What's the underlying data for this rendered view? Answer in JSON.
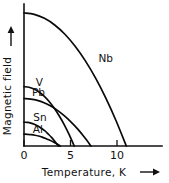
{
  "chart_data": {
    "type": "line",
    "title": "",
    "xlabel": "Temperature, K",
    "ylabel": "Magnetic field",
    "xlim": [
      0,
      12.3
    ],
    "ylim": [
      0,
      1.0
    ],
    "grid": false,
    "legend": "inline-curve-labels",
    "x_ticks": [
      {
        "value": 0,
        "label": "0"
      },
      {
        "value": 5,
        "label": "5"
      },
      {
        "value": 10,
        "label": "10"
      }
    ],
    "y_ticks": [],
    "x_axis_arrow": true,
    "y_axis_arrow": true,
    "series": [
      {
        "name": "Nb",
        "label": "Nb",
        "critical_temperature_K": 11.0,
        "critical_field_relative": 1.0,
        "points": [
          {
            "x": 0.0,
            "y": 1.0
          },
          {
            "x": 1.1,
            "y": 0.99
          },
          {
            "x": 2.2,
            "y": 0.96
          },
          {
            "x": 3.3,
            "y": 0.91
          },
          {
            "x": 4.4,
            "y": 0.84
          },
          {
            "x": 5.5,
            "y": 0.75
          },
          {
            "x": 6.6,
            "y": 0.64
          },
          {
            "x": 7.7,
            "y": 0.51
          },
          {
            "x": 8.8,
            "y": 0.36
          },
          {
            "x": 9.9,
            "y": 0.19
          },
          {
            "x": 11.0,
            "y": 0.0
          }
        ],
        "label_position": {
          "x": 8.0,
          "y": 0.63
        }
      },
      {
        "name": "V",
        "label": "V",
        "critical_temperature_K": 5.4,
        "critical_field_relative": 0.446,
        "points": [
          {
            "x": 0.0,
            "y": 0.446
          },
          {
            "x": 0.54,
            "y": 0.442
          },
          {
            "x": 1.08,
            "y": 0.428
          },
          {
            "x": 1.62,
            "y": 0.406
          },
          {
            "x": 2.16,
            "y": 0.375
          },
          {
            "x": 2.7,
            "y": 0.335
          },
          {
            "x": 3.24,
            "y": 0.286
          },
          {
            "x": 3.78,
            "y": 0.227
          },
          {
            "x": 4.32,
            "y": 0.161
          },
          {
            "x": 4.86,
            "y": 0.085
          },
          {
            "x": 5.4,
            "y": 0.0
          }
        ],
        "label_position": {
          "x": 1.25,
          "y": 0.45
        }
      },
      {
        "name": "Pb",
        "label": "Pb",
        "critical_temperature_K": 7.2,
        "critical_field_relative": 0.357,
        "points": [
          {
            "x": 0.0,
            "y": 0.357
          },
          {
            "x": 0.72,
            "y": 0.353
          },
          {
            "x": 1.44,
            "y": 0.343
          },
          {
            "x": 2.16,
            "y": 0.325
          },
          {
            "x": 2.88,
            "y": 0.3
          },
          {
            "x": 3.6,
            "y": 0.268
          },
          {
            "x": 4.32,
            "y": 0.228
          },
          {
            "x": 5.04,
            "y": 0.182
          },
          {
            "x": 5.76,
            "y": 0.129
          },
          {
            "x": 6.48,
            "y": 0.068
          },
          {
            "x": 7.2,
            "y": 0.0
          }
        ],
        "label_position": {
          "x": 0.85,
          "y": 0.375
        }
      },
      {
        "name": "Sn",
        "label": "Sn",
        "critical_temperature_K": 3.7,
        "critical_field_relative": 0.179,
        "points": [
          {
            "x": 0.0,
            "y": 0.179
          },
          {
            "x": 0.37,
            "y": 0.177
          },
          {
            "x": 0.74,
            "y": 0.172
          },
          {
            "x": 1.11,
            "y": 0.163
          },
          {
            "x": 1.48,
            "y": 0.15
          },
          {
            "x": 1.85,
            "y": 0.134
          },
          {
            "x": 2.22,
            "y": 0.115
          },
          {
            "x": 2.59,
            "y": 0.091
          },
          {
            "x": 2.96,
            "y": 0.065
          },
          {
            "x": 3.33,
            "y": 0.034
          },
          {
            "x": 3.7,
            "y": 0.0
          }
        ],
        "label_position": {
          "x": 1.0,
          "y": 0.185
        }
      },
      {
        "name": "Al",
        "label": "Al",
        "critical_temperature_K": 3.9,
        "critical_field_relative": 0.089,
        "points": [
          {
            "x": 0.0,
            "y": 0.089
          },
          {
            "x": 0.39,
            "y": 0.088
          },
          {
            "x": 0.78,
            "y": 0.085
          },
          {
            "x": 1.17,
            "y": 0.081
          },
          {
            "x": 1.56,
            "y": 0.075
          },
          {
            "x": 1.95,
            "y": 0.067
          },
          {
            "x": 2.34,
            "y": 0.057
          },
          {
            "x": 2.73,
            "y": 0.045
          },
          {
            "x": 3.12,
            "y": 0.032
          },
          {
            "x": 3.51,
            "y": 0.017
          },
          {
            "x": 3.9,
            "y": 0.0
          }
        ],
        "label_position": {
          "x": 0.95,
          "y": 0.1
        }
      }
    ]
  },
  "figure": {
    "xlabel_text": "Temperature, K",
    "ylabel_text": "Magnetic field",
    "tick_0": "0",
    "tick_5": "5",
    "tick_10": "10",
    "label_nb": "Nb",
    "label_v": "V",
    "label_pb": "Pb",
    "label_sn": "Sn",
    "label_al": "Al",
    "colors": {
      "ink": "#111111",
      "background": "#ffffff"
    }
  }
}
